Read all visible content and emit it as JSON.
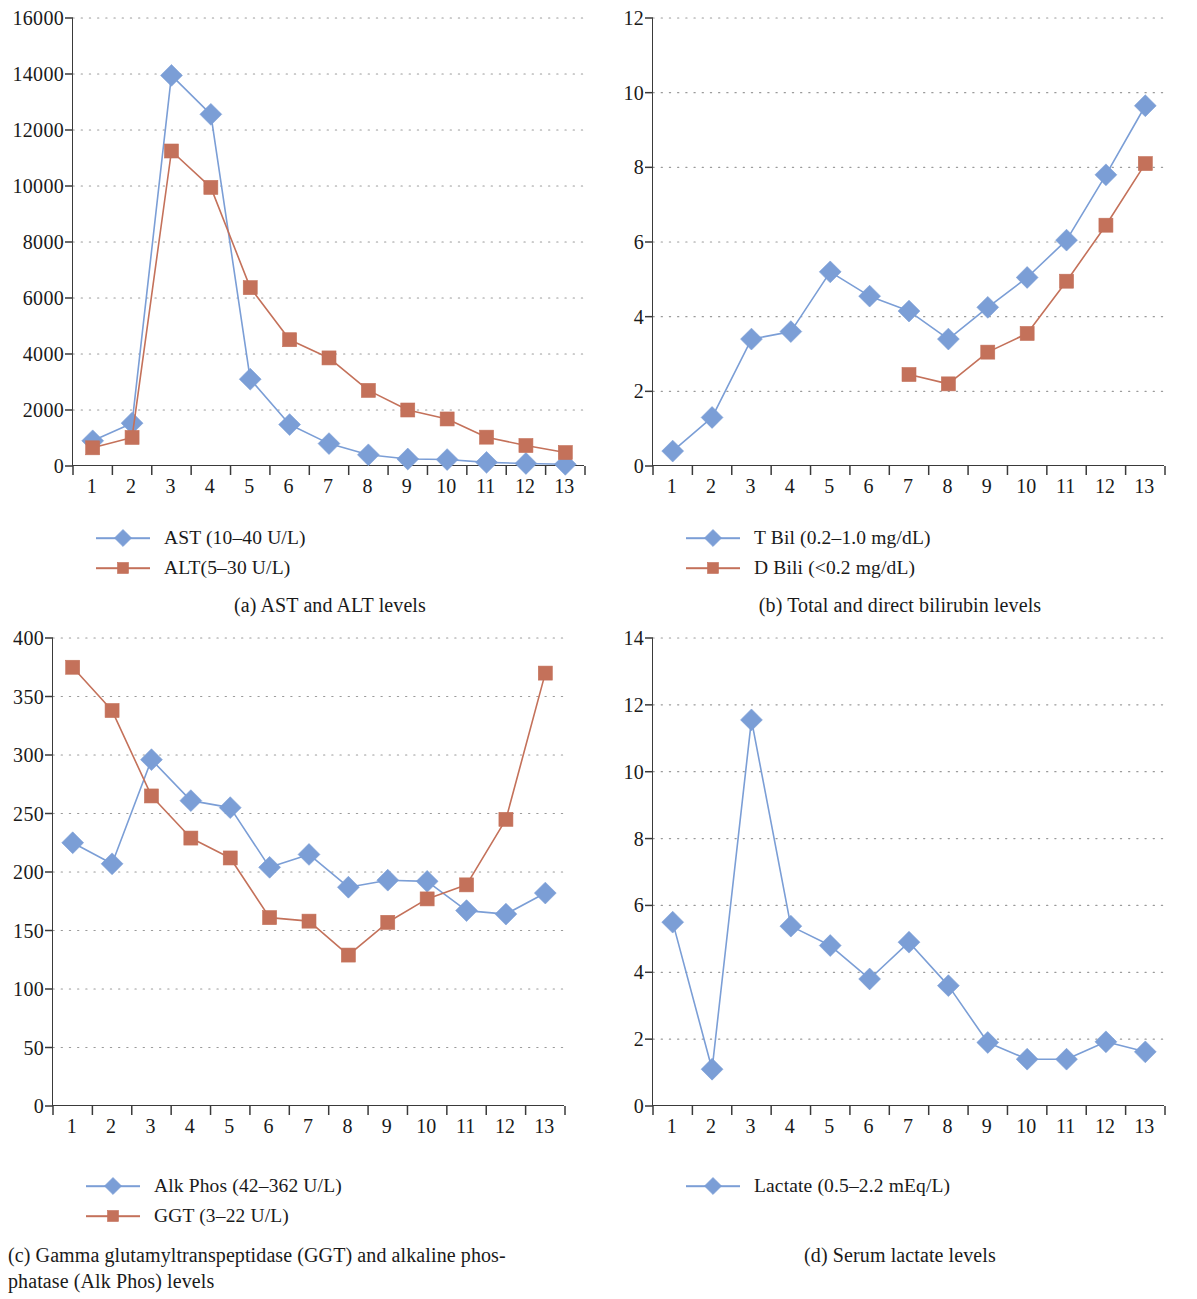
{
  "figure": {
    "panels": [
      "a",
      "b",
      "c",
      "d"
    ]
  },
  "panel_a": {
    "caption": "(a)  AST and ALT levels",
    "legend": [
      {
        "label": "AST (10–40 U/L)",
        "color": "#7b9ed6",
        "marker": "diamond"
      },
      {
        "label": "ALT(5–30 U/L)",
        "color": "#c4715a",
        "marker": "square"
      }
    ]
  },
  "panel_b": {
    "caption": "(b)  Total and direct bilirubin levels",
    "legend": [
      {
        "label": "T Bil (0.2–1.0 mg/dL)",
        "color": "#7b9ed6",
        "marker": "diamond"
      },
      {
        "label": "D Bili (<0.2 mg/dL)",
        "color": "#c4715a",
        "marker": "square"
      }
    ]
  },
  "panel_c": {
    "caption": "(c)  Gamma  glutamyltranspeptidase  (GGT)  and  alkaline  phos-phatase (Alk Phos) levels",
    "caption_line1": "(c)  Gamma  glutamyltranspeptidase  (GGT)  and  alkaline  phos-",
    "caption_line2": "phatase (Alk Phos) levels",
    "legend": [
      {
        "label": "Alk Phos (42–362 U/L)",
        "color": "#7b9ed6",
        "marker": "diamond"
      },
      {
        "label": "GGT (3–22 U/L)",
        "color": "#c4715a",
        "marker": "square"
      }
    ]
  },
  "panel_d": {
    "caption": "(d)  Serum lactate levels",
    "legend": [
      {
        "label": "Lactate (0.5–2.2 mEq/L)",
        "color": "#7b9ed6",
        "marker": "diamond"
      }
    ]
  },
  "chart_data": [
    {
      "panel": "a",
      "type": "line",
      "title": "AST and ALT levels",
      "xlabel": "",
      "ylabel": "",
      "x": [
        1,
        2,
        3,
        4,
        5,
        6,
        7,
        8,
        9,
        10,
        11,
        12,
        13
      ],
      "categories": [
        "1",
        "2",
        "3",
        "4",
        "5",
        "6",
        "7",
        "8",
        "9",
        "10",
        "11",
        "12",
        "13"
      ],
      "xticklabels": [
        "1",
        "2",
        "3",
        "4",
        "5",
        "6",
        "7",
        "8",
        "9",
        "10",
        "11",
        "12",
        "13"
      ],
      "yticklabels": [
        "0",
        "2000",
        "4000",
        "6000",
        "8000",
        "10000",
        "12000",
        "14000",
        "16000"
      ],
      "ylim": [
        0,
        16000
      ],
      "ytick_step": 2000,
      "grid": true,
      "legend_position": "below-left",
      "series": [
        {
          "name": "AST (10–40 U/L)",
          "color": "#7b9ed6",
          "marker": "diamond",
          "values": [
            900,
            1530,
            13950,
            12560,
            3100,
            1480,
            800,
            400,
            250,
            230,
            130,
            90,
            60
          ]
        },
        {
          "name": "ALT(5–30 U/L)",
          "color": "#c4715a",
          "marker": "square",
          "values": [
            650,
            1020,
            11250,
            9950,
            6370,
            4510,
            3860,
            2700,
            2000,
            1680,
            1030,
            730,
            480
          ]
        }
      ]
    },
    {
      "panel": "b",
      "type": "line",
      "title": "Total and direct bilirubin levels",
      "xlabel": "",
      "ylabel": "",
      "x": [
        1,
        2,
        3,
        4,
        5,
        6,
        7,
        8,
        9,
        10,
        11,
        12,
        13
      ],
      "categories": [
        "1",
        "2",
        "3",
        "4",
        "5",
        "6",
        "7",
        "8",
        "9",
        "10",
        "11",
        "12",
        "13"
      ],
      "xticklabels": [
        "1",
        "2",
        "3",
        "4",
        "5",
        "6",
        "7",
        "8",
        "9",
        "10",
        "11",
        "12",
        "13"
      ],
      "yticklabels": [
        "0",
        "2",
        "4",
        "6",
        "8",
        "10",
        "12"
      ],
      "ylim": [
        0,
        12
      ],
      "ytick_step": 2,
      "grid": true,
      "legend_position": "below-left",
      "series": [
        {
          "name": "T Bil (0.2–1.0 mg/dL)",
          "color": "#7b9ed6",
          "marker": "diamond",
          "values": [
            0.4,
            1.3,
            3.4,
            3.6,
            5.2,
            4.55,
            4.15,
            3.4,
            4.25,
            5.05,
            6.05,
            7.8,
            9.65
          ]
        },
        {
          "name": "D Bili (<0.2 mg/dL)",
          "color": "#c4715a",
          "marker": "square",
          "values": [
            null,
            null,
            null,
            null,
            null,
            null,
            2.45,
            2.2,
            3.05,
            3.55,
            4.95,
            6.45,
            8.1
          ]
        }
      ]
    },
    {
      "panel": "c",
      "type": "line",
      "title": "Gamma glutamyltranspeptidase (GGT) and alkaline phosphatase (Alk Phos) levels",
      "xlabel": "",
      "ylabel": "",
      "x": [
        1,
        2,
        3,
        4,
        5,
        6,
        7,
        8,
        9,
        10,
        11,
        12,
        13
      ],
      "categories": [
        "1",
        "2",
        "3",
        "4",
        "5",
        "6",
        "7",
        "8",
        "9",
        "10",
        "11",
        "12",
        "13"
      ],
      "xticklabels": [
        "1",
        "2",
        "3",
        "4",
        "5",
        "6",
        "7",
        "8",
        "9",
        "10",
        "11",
        "12",
        "13"
      ],
      "yticklabels": [
        "0",
        "50",
        "100",
        "150",
        "200",
        "250",
        "300",
        "350",
        "400"
      ],
      "ylim": [
        0,
        400
      ],
      "ytick_step": 50,
      "grid": true,
      "legend_position": "below-left",
      "series": [
        {
          "name": "Alk Phos (42–362 U/L)",
          "color": "#7b9ed6",
          "marker": "diamond",
          "values": [
            225,
            207,
            296,
            261,
            255,
            204,
            215,
            187,
            193,
            192,
            167,
            164,
            182
          ]
        },
        {
          "name": "GGT (3–22 U/L)",
          "color": "#c4715a",
          "marker": "square",
          "values": [
            375,
            338,
            265,
            229,
            212,
            161,
            158,
            129,
            157,
            177,
            189,
            245,
            370
          ]
        }
      ]
    },
    {
      "panel": "d",
      "type": "line",
      "title": "Serum lactate levels",
      "xlabel": "",
      "ylabel": "",
      "x": [
        1,
        2,
        3,
        4,
        5,
        6,
        7,
        8,
        9,
        10,
        11,
        12,
        13
      ],
      "categories": [
        "1",
        "2",
        "3",
        "4",
        "5",
        "6",
        "7",
        "8",
        "9",
        "10",
        "11",
        "12",
        "13"
      ],
      "xticklabels": [
        "1",
        "2",
        "3",
        "4",
        "5",
        "6",
        "7",
        "8",
        "9",
        "10",
        "11",
        "12",
        "13"
      ],
      "yticklabels": [
        "0",
        "2",
        "4",
        "6",
        "8",
        "10",
        "12",
        "14"
      ],
      "ylim": [
        0,
        14
      ],
      "ytick_step": 2,
      "grid": true,
      "legend_position": "below-left",
      "series": [
        {
          "name": "Lactate (0.5–2.2 mEq/L)",
          "color": "#7b9ed6",
          "marker": "diamond",
          "values": [
            5.5,
            1.1,
            11.55,
            5.38,
            4.8,
            3.8,
            4.9,
            3.6,
            1.9,
            1.4,
            1.4,
            1.92,
            1.62
          ]
        }
      ]
    }
  ]
}
